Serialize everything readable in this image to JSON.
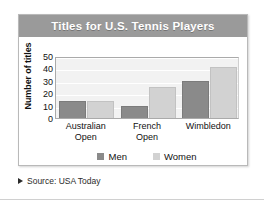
{
  "figure": {
    "title": "Titles for U.S. Tennis Players",
    "source_marker": "triangle-right",
    "source": "Source: USA Today"
  },
  "colors": {
    "title_band": "#9a9a9a",
    "title_text": "#ffffff",
    "men": "#8a8a8a",
    "women": "#d2d2d2",
    "plot_background": "#f2f2f2",
    "gridline": "#ffffff",
    "axis": "#aaaaaa",
    "text": "#111111"
  },
  "chart_data": {
    "type": "bar",
    "title": "Titles for U.S. Tennis Players",
    "xlabel": "",
    "ylabel": "Number of titles",
    "categories": [
      "Australian Open",
      "French Open",
      "Wimbledon"
    ],
    "category_lines": [
      [
        "Australian",
        "Open"
      ],
      [
        "French",
        "Open"
      ],
      [
        "Wimbledon"
      ]
    ],
    "series": [
      {
        "name": "Men",
        "values": [
          14,
          10,
          30
        ]
      },
      {
        "name": "Women",
        "values": [
          14,
          25,
          41
        ]
      }
    ],
    "ylim": [
      0,
      50
    ],
    "yticks": [
      50,
      40,
      30,
      20,
      10,
      0
    ],
    "ytick_labels": [
      "50",
      "40",
      "30",
      "20",
      "10",
      "0"
    ],
    "grid": true,
    "legend_position": "bottom",
    "legend": [
      "Men",
      "Women"
    ]
  }
}
